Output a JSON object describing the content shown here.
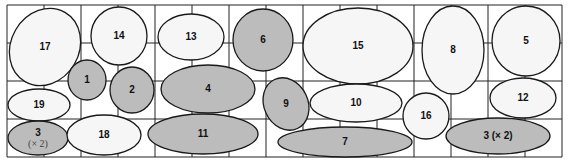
{
  "colors": {
    "gray": "#bcbcbc",
    "light": "#f6f6f6",
    "stroke": "#1a1a1a",
    "grid": "#222222"
  },
  "grid": {
    "x0": 7,
    "y0": 5,
    "x1": 562,
    "y1": 157,
    "cols": 15,
    "rows": 4
  },
  "shapes": [
    {
      "label": "17",
      "cx": 45,
      "cy": 47,
      "rx": 34,
      "ry": 40,
      "rot": 30,
      "fill": "light"
    },
    {
      "label": "14",
      "cx": 119,
      "cy": 36,
      "rx": 28,
      "ry": 29,
      "rot": 0,
      "fill": "light"
    },
    {
      "label": "13",
      "cx": 191,
      "cy": 37,
      "rx": 33,
      "ry": 23,
      "rot": 0,
      "fill": "light"
    },
    {
      "label": "6",
      "cx": 263,
      "cy": 40,
      "rx": 30,
      "ry": 31,
      "rot": 0,
      "fill": "gray"
    },
    {
      "label": "15",
      "cx": 358,
      "cy": 46,
      "rx": 55,
      "ry": 38,
      "rot": 0,
      "fill": "light"
    },
    {
      "label": "8",
      "cx": 453,
      "cy": 50,
      "rx": 31,
      "ry": 44,
      "rot": 0,
      "fill": "light"
    },
    {
      "label": "5",
      "cx": 526,
      "cy": 41,
      "rx": 34,
      "ry": 35,
      "rot": 0,
      "fill": "light"
    },
    {
      "label": "1",
      "cx": 87,
      "cy": 80,
      "rx": 19,
      "ry": 20,
      "rot": 0,
      "fill": "gray"
    },
    {
      "label": "2",
      "cx": 132,
      "cy": 90,
      "rx": 22,
      "ry": 23,
      "rot": 0,
      "fill": "gray"
    },
    {
      "label": "4",
      "cx": 208,
      "cy": 89,
      "rx": 47,
      "ry": 24,
      "rot": 0,
      "fill": "gray"
    },
    {
      "label": "9",
      "cx": 286,
      "cy": 104,
      "rx": 22,
      "ry": 27,
      "rot": -25,
      "fill": "gray"
    },
    {
      "label": "10",
      "cx": 356,
      "cy": 103,
      "rx": 46,
      "ry": 19,
      "rot": 0,
      "fill": "light"
    },
    {
      "label": "16",
      "cx": 426,
      "cy": 116,
      "rx": 23,
      "ry": 23,
      "rot": 0,
      "fill": "light"
    },
    {
      "label": "12",
      "cx": 523,
      "cy": 98,
      "rx": 33,
      "ry": 20,
      "rot": 0,
      "fill": "light"
    },
    {
      "label": "19",
      "cx": 39,
      "cy": 105,
      "rx": 31,
      "ry": 16,
      "rot": 0,
      "fill": "light"
    },
    {
      "label": "3",
      "sub": "(× 2)",
      "cx": 38,
      "cy": 138,
      "rx": 30,
      "ry": 17,
      "rot": 0,
      "fill": "gray"
    },
    {
      "label": "18",
      "cx": 104,
      "cy": 135,
      "rx": 37,
      "ry": 20,
      "rot": 0,
      "fill": "light"
    },
    {
      "label": "11",
      "cx": 203,
      "cy": 134,
      "rx": 55,
      "ry": 20,
      "rot": 0,
      "fill": "gray"
    },
    {
      "label": "7",
      "cx": 345,
      "cy": 142,
      "rx": 67,
      "ry": 15,
      "rot": 0,
      "fill": "gray"
    },
    {
      "label": "3 (× 2)",
      "cx": 498,
      "cy": 136,
      "rx": 52,
      "ry": 18,
      "rot": 0,
      "fill": "gray"
    }
  ]
}
